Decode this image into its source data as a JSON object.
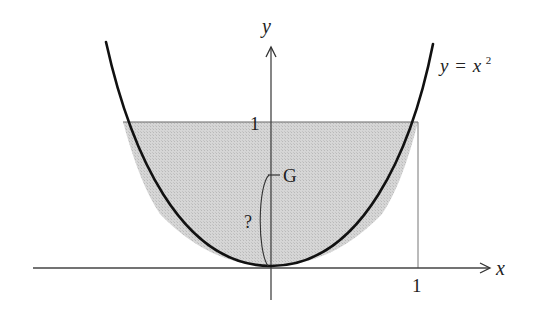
{
  "diagram": {
    "curve_label": {
      "lhs": "y",
      "eq": "=",
      "rhs_base": "x",
      "rhs_exp": "2"
    },
    "axes": {
      "x_label": "x",
      "y_label": "y",
      "x_tick": "1",
      "y_tick": "1"
    },
    "centroid_label": "G",
    "unknown_label": "?",
    "colors": {
      "fill": "#cfcfcf",
      "curve": "#111111",
      "axis": "#333333",
      "text": "#222222"
    }
  }
}
